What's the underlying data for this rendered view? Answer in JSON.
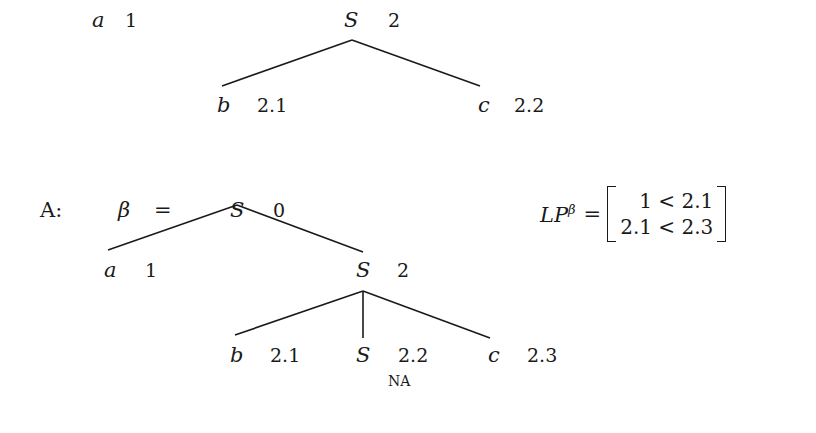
{
  "top_tree": {
    "left_leaf": {
      "symbol": "a",
      "index": "1"
    },
    "root": {
      "symbol": "S",
      "index": "2"
    },
    "children": [
      {
        "symbol": "b",
        "index": "2.1"
      },
      {
        "symbol": "c",
        "index": "2.2"
      }
    ]
  },
  "section_a": {
    "label": "A:",
    "beta": "β",
    "equals": "=",
    "root": {
      "symbol": "S",
      "index": "0"
    },
    "children": [
      {
        "symbol": "a",
        "index": "1"
      },
      {
        "symbol": "S",
        "index": "2"
      }
    ],
    "grandchildren": [
      {
        "symbol": "b",
        "index": "2.1"
      },
      {
        "symbol": "S",
        "index": "2.2",
        "annotation": "NA"
      },
      {
        "symbol": "c",
        "index": "2.3"
      }
    ]
  },
  "lp_matrix": {
    "lhs": "LP",
    "superscript": "β",
    "equals": "=",
    "rows": [
      "1 < 2.1",
      "2.1 < 2.3"
    ]
  }
}
